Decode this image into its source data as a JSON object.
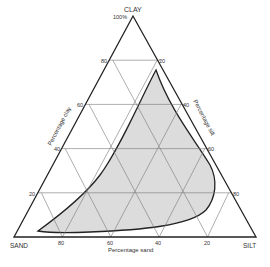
{
  "diagram": {
    "type": "ternary",
    "vertices": {
      "top": {
        "label": "CLAY",
        "sublabel": "100%"
      },
      "left": {
        "label": "SAND"
      },
      "right": {
        "label": "SILT"
      }
    },
    "axes": {
      "clay": {
        "title": "Percentage clay",
        "ticks": [
          "20",
          "40",
          "60",
          "80"
        ]
      },
      "silt": {
        "title": "Percentage silt",
        "ticks": [
          "20",
          "40",
          "60",
          "80"
        ]
      },
      "sand": {
        "title": "Percentage sand",
        "ticks": [
          "80",
          "60",
          "40",
          "20"
        ]
      }
    },
    "grid_step": 20,
    "shaded_region": {
      "fill": "#dcdcdc",
      "stroke": "#222222",
      "description": "Region of observed soil compositions"
    },
    "colors": {
      "line": "#222222",
      "grid": "#777777",
      "text": "#333333"
    }
  }
}
